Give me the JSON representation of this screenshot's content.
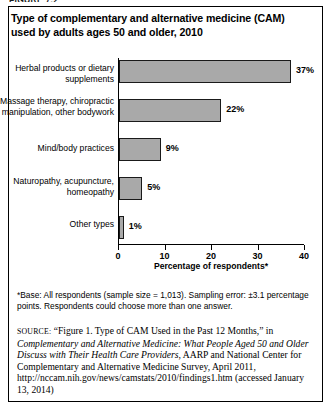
{
  "figure": {
    "label": "FIGURE 7.2"
  },
  "title": "Type of complementary and alternative medicine (CAM) used by adults ages 50 and older, 2010",
  "footnote": "*Base: All respondents (sample size = 1,013). Sampling error: ±3.1 percentage points. Respondents could choose more than one answer.",
  "source": {
    "keyword": "source:",
    "part1": " “Figure 1. Type of CAM Used in the Past 12 Months,” in ",
    "italic_title": "Complementary and Alternative Medicine: What People Aged 50 and Older Discuss with Their Health Care Providers",
    "part2": ", AARP and National Center for Complementary and Alternative Medicine Survey, April 2011, http://nccam.nih.gov/news/camstats/2010/findings1.htm (accessed January 13, 2014)"
  },
  "colors": {
    "bar_fill": "#a9a9a9",
    "bar_stroke": "#1a1a1a",
    "axis": "#000000",
    "text": "#000000"
  },
  "chart_data": {
    "type": "bar",
    "orientation": "horizontal",
    "title": "Type of complementary and alternative medicine (CAM) used by adults ages 50 and older, 2010",
    "categories": [
      "Herbal products or dietary supplements",
      "Massage therapy, chiropractic manipulation, other bodywork",
      "Mind/body practices",
      "Naturopathy, acupuncture, homeopathy",
      "Other types"
    ],
    "values": [
      37,
      22,
      9,
      5,
      1
    ],
    "data_labels": [
      "37%",
      "22%",
      "9%",
      "5%",
      "1%"
    ],
    "xlabel": "Percentage of respondents*",
    "ylabel": "",
    "xlim": [
      0,
      40
    ],
    "xticks": [
      0,
      10,
      20,
      30,
      40
    ],
    "xtick_labels": [
      "0",
      "10",
      "20",
      "30",
      "40"
    ],
    "grid": false,
    "legend": false
  }
}
